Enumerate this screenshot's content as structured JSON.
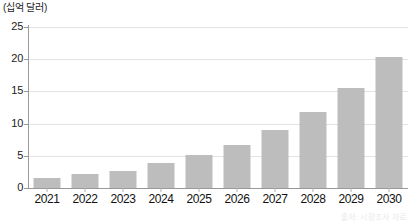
{
  "chart_data": {
    "type": "bar",
    "title": "",
    "unit_label": "(십억 달러)",
    "xlabel": "",
    "ylabel": "",
    "categories": [
      "2021",
      "2022",
      "2023",
      "2024",
      "2025",
      "2026",
      "2027",
      "2028",
      "2029",
      "2030"
    ],
    "values": [
      1.5,
      2.1,
      2.7,
      3.9,
      5.2,
      6.7,
      9.0,
      11.8,
      15.5,
      20.4
    ],
    "series": [
      {
        "name": "",
        "values": [
          1.5,
          2.1,
          2.7,
          3.9,
          5.2,
          6.7,
          9.0,
          11.8,
          15.5,
          20.4
        ]
      }
    ],
    "ylim": [
      0,
      25
    ],
    "y_ticks": [
      "0",
      "5",
      "10",
      "15",
      "20",
      "25"
    ],
    "y_tick_values": [
      0,
      5,
      10,
      15,
      20,
      25
    ],
    "grid": true,
    "legend": "none",
    "bar_color": "#bdbdbd",
    "gridline_color": "#e2e2e2",
    "axis_color": "#9a9a9a"
  },
  "footer": {
    "source_note": "출처: 시장조사 자료"
  }
}
